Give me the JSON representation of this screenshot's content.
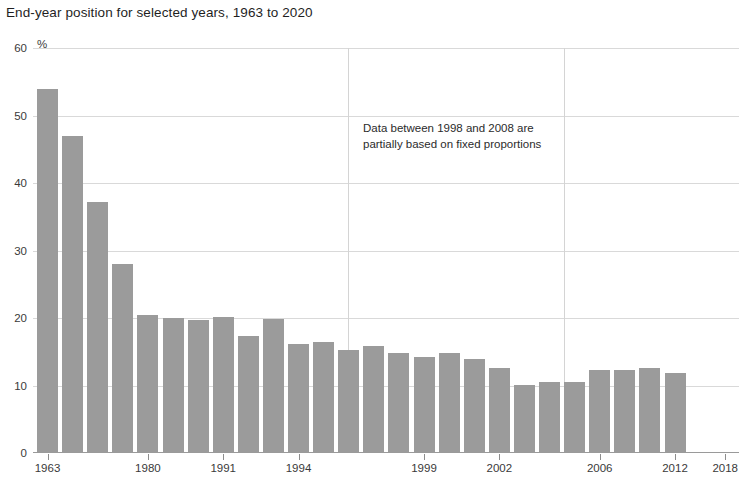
{
  "chart_data": {
    "type": "bar",
    "title": "End-year position for selected years, 1963 to 2020",
    "xlabel": "",
    "ylabel": "",
    "yunit": "%",
    "ylim": [
      0,
      60
    ],
    "ytick_labels": [
      "0",
      "10",
      "20",
      "30",
      "40",
      "50",
      "60"
    ],
    "ytick_values": [
      0,
      10,
      20,
      30,
      40,
      50,
      60
    ],
    "grid": "horizontal-and-two-verticals",
    "legend": "none",
    "bar_color": "#9b9b9b",
    "categories": [
      "1963",
      "1964",
      "1970",
      "1975",
      "1980",
      "1985",
      "1988",
      "1991",
      "1992",
      "1993",
      "1994",
      "1995",
      "1996",
      "1997",
      "1998",
      "1999",
      "2000",
      "2001",
      "2002",
      "2003",
      "2004",
      "2005",
      "2006",
      "2007",
      "2008",
      "2012",
      "2015",
      "2018",
      "2019",
      "2020"
    ],
    "values": [
      54,
      47,
      37.2,
      28,
      20.4,
      20,
      19.7,
      20.2,
      17.4,
      19.9,
      16.2,
      16.5,
      15.2,
      15.8,
      14.8,
      14.2,
      14.8,
      14,
      12.6,
      10.1,
      10.5,
      10.5,
      12.3,
      12.3,
      12.6,
      11.8,
      0,
      0,
      0,
      0
    ],
    "xtick_labels": [
      "1963",
      "1980",
      "1991",
      "1994",
      "1999",
      "2002",
      "2006",
      "2012",
      "2018"
    ],
    "xtick_bar_index": [
      0,
      4,
      7,
      10,
      15,
      18,
      22,
      25,
      27
    ],
    "annotations": [
      {
        "name": "fixed-proportions-note",
        "text": "Data between 1998 and 2008 are partially based on fixed proportions"
      }
    ],
    "vertical_gridline_positions_px": [
      348,
      564
    ]
  }
}
